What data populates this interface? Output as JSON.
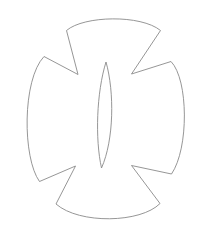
{
  "document": {
    "title": "Cross Outline Drawing",
    "width": 199,
    "height": 239,
    "background_color": "#ffffff"
  },
  "drawing": {
    "name": "cross-outline",
    "description": "Line-art outline of a four-armed cross with concave flared arms and a central vertical leaf shape",
    "stroke_color": "#8a8a8a",
    "fill_color": "#ffffff",
    "stroke_width": 0.9,
    "shapes": [
      {
        "name": "cross-body",
        "kind": "closed-path",
        "path": "M 66.5 30.5 C 84 15.5 141 14.5 160.5 30.5 L 131.5 74.0 L 171.0 61.5 C 188.5 79.5 189.0 148.5 171.5 174.0 L 131.5 165.5 L 160.0 203.5 C 141.0 223.0 79.5 224.5 56.0 204.0 L 75.5 166.0 L 39.5 181.5 C 22.5 158.0 22.0 80.0 44.0 56.5 L 78.0 74.5 Z"
      },
      {
        "name": "center-leaf",
        "kind": "closed-path",
        "path": "M 106.0 62.0 C 114.5 92.0 114.0 140.0 101.5 168.0 C 95.0 139.0 96.5 92.5 106.0 62.0 Z"
      }
    ]
  }
}
